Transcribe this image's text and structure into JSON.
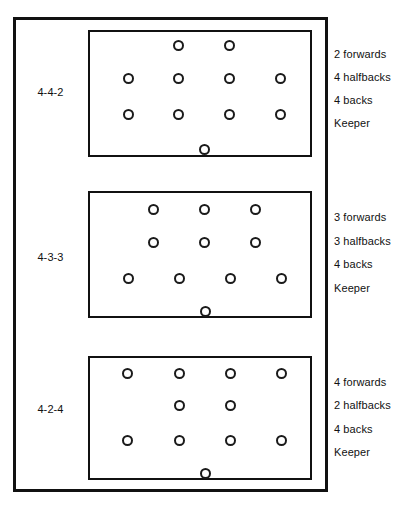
{
  "figure": {
    "width": 400,
    "height": 507,
    "line_color": "#111111",
    "background_color": "#ffffff"
  },
  "formations": [
    {
      "name": "4-4-2",
      "pitch": {
        "top": 30,
        "height": 127
      },
      "roles": [
        {
          "label": "2 forwards",
          "y": 55
        },
        {
          "label": "4 halfbacks",
          "y": 78
        },
        {
          "label": "4 backs",
          "y": 101
        },
        {
          "label": "Keeper",
          "y": 124
        }
      ],
      "name_y": 93,
      "rows": [
        {
          "role": "forwards",
          "count": 2,
          "y": 45,
          "xs": [
            178,
            229
          ]
        },
        {
          "role": "halfbacks",
          "count": 4,
          "y": 78,
          "xs": [
            128,
            178,
            229,
            280
          ]
        },
        {
          "role": "backs",
          "count": 4,
          "y": 114,
          "xs": [
            128,
            178,
            229,
            280
          ]
        },
        {
          "role": "keeper",
          "count": 1,
          "y": 149,
          "xs": [
            204
          ]
        }
      ]
    },
    {
      "name": "4-3-3",
      "pitch": {
        "top": 191,
        "height": 127
      },
      "roles": [
        {
          "label": "3 forwards",
          "y": 218
        },
        {
          "label": "3 halfbacks",
          "y": 242
        },
        {
          "label": "4 backs",
          "y": 265
        },
        {
          "label": "Keeper",
          "y": 289
        }
      ],
      "name_y": 258,
      "rows": [
        {
          "role": "forwards",
          "count": 3,
          "y": 209,
          "xs": [
            153,
            204,
            255
          ]
        },
        {
          "role": "halfbacks",
          "count": 3,
          "y": 242,
          "xs": [
            153,
            204,
            255
          ]
        },
        {
          "role": "backs",
          "count": 4,
          "y": 278,
          "xs": [
            128,
            179,
            230,
            281
          ]
        },
        {
          "role": "keeper",
          "count": 1,
          "y": 311,
          "xs": [
            205
          ]
        }
      ]
    },
    {
      "name": "4-2-4",
      "pitch": {
        "top": 356,
        "height": 124
      },
      "roles": [
        {
          "label": "4 forwards",
          "y": 383
        },
        {
          "label": "2 halfbacks",
          "y": 406
        },
        {
          "label": "4 backs",
          "y": 430
        },
        {
          "label": "Keeper",
          "y": 453
        }
      ],
      "name_y": 410,
      "rows": [
        {
          "role": "forwards",
          "count": 4,
          "y": 373,
          "xs": [
            127,
            179,
            230,
            281
          ]
        },
        {
          "role": "halfbacks",
          "count": 2,
          "y": 405,
          "xs": [
            179,
            230
          ]
        },
        {
          "role": "backs",
          "count": 4,
          "y": 440,
          "xs": [
            127,
            179,
            230,
            281
          ]
        },
        {
          "role": "keeper",
          "count": 1,
          "y": 473,
          "xs": [
            205
          ]
        }
      ]
    }
  ]
}
